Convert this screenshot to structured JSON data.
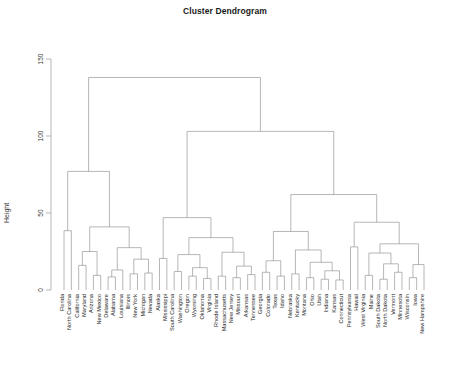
{
  "chart_data": {
    "type": "dendrogram",
    "title": "Cluster Dendrogram",
    "xlabel": "",
    "ylabel": "Height",
    "ylim": [
      0,
      155
    ],
    "yticks": [
      0,
      50,
      100,
      150
    ],
    "ytick_labels": [
      "0",
      "50",
      "100",
      "150"
    ],
    "grid": false,
    "legend": null,
    "linkage": "complete",
    "n_leaves": 50,
    "leaf_order": [
      "Florida",
      "North Carolina",
      "California",
      "Maryland",
      "Arizona",
      "New Mexico",
      "Delaware",
      "Alabama",
      "Louisiana",
      "Illinois",
      "New York",
      "Michigan",
      "Nevada",
      "Alaska",
      "Mississippi",
      "South Carolina",
      "Washington",
      "Oregon",
      "Wyoming",
      "Oklahoma",
      "Virginia",
      "Rhode Island",
      "Massachusetts",
      "New Jersey",
      "Missouri",
      "Arkansas",
      "Tennessee",
      "Georgia",
      "Colorado",
      "Texas",
      "Idaho",
      "Nebraska",
      "Kentucky",
      "Montana",
      "Ohio",
      "Utah",
      "Indiana",
      "Kansas",
      "Connecticut",
      "Pennsylvania",
      "Hawaii",
      "West Virginia",
      "Maine",
      "South Dakota",
      "North Dakota",
      "Vermont",
      "Minnesota",
      "Wisconsin",
      "Iowa",
      "New Hampshire"
    ],
    "merges": [
      {
        "id": 1,
        "left": "Florida",
        "right": "North Carolina",
        "height": 38.5
      },
      {
        "id": 2,
        "left": "California",
        "right": "Maryland",
        "height": 16.0
      },
      {
        "id": 3,
        "left": "Arizona",
        "right": "New Mexico",
        "height": 9.5
      },
      {
        "id": 4,
        "left": "m2",
        "right": "m3",
        "height": 25.0
      },
      {
        "id": 5,
        "left": "Delaware",
        "right": "Alabama",
        "height": 8.5
      },
      {
        "id": 6,
        "left": "m5",
        "right": "Louisiana",
        "height": 13.0
      },
      {
        "id": 7,
        "left": "Illinois",
        "right": "New York",
        "height": 10.5
      },
      {
        "id": 8,
        "left": "Michigan",
        "right": "Nevada",
        "height": 11.0
      },
      {
        "id": 9,
        "left": "m7",
        "right": "m8",
        "height": 20.0
      },
      {
        "id": 10,
        "left": "m6",
        "right": "m9",
        "height": 27.5
      },
      {
        "id": 11,
        "left": "m4",
        "right": "m10",
        "height": 41.0
      },
      {
        "id": 12,
        "left": "m1",
        "right": "m11",
        "height": 77.0
      },
      {
        "id": 13,
        "left": "Alaska",
        "right": "Mississippi",
        "height": 20.5
      },
      {
        "id": 14,
        "left": "South Carolina",
        "right": "Washington",
        "height": 12.0
      },
      {
        "id": 15,
        "left": "Oregon",
        "right": "Wyoming",
        "height": 9.0
      },
      {
        "id": 16,
        "left": "Oklahoma",
        "right": "Virginia",
        "height": 7.5
      },
      {
        "id": 17,
        "left": "m15",
        "right": "m16",
        "height": 14.5
      },
      {
        "id": 18,
        "left": "m14",
        "right": "m17",
        "height": 23.0
      },
      {
        "id": 19,
        "left": "Rhode Island",
        "right": "Massachusetts",
        "height": 9.0
      },
      {
        "id": 20,
        "left": "New Jersey",
        "right": "Missouri",
        "height": 8.0
      },
      {
        "id": 21,
        "left": "Arkansas",
        "right": "Tennessee",
        "height": 10.0
      },
      {
        "id": 22,
        "left": "m20",
        "right": "m21",
        "height": 15.5
      },
      {
        "id": 23,
        "left": "m19",
        "right": "m22",
        "height": 24.5
      },
      {
        "id": 24,
        "left": "m18",
        "right": "m23",
        "height": 34.0
      },
      {
        "id": 25,
        "left": "m13",
        "right": "m24",
        "height": 47.0
      },
      {
        "id": 26,
        "left": "Georgia",
        "right": "Colorado",
        "height": 11.5
      },
      {
        "id": 27,
        "left": "Texas",
        "right": "Idaho",
        "height": 9.0
      },
      {
        "id": 28,
        "left": "m26",
        "right": "m27",
        "height": 19.0
      },
      {
        "id": 29,
        "left": "Nebraska",
        "right": "Kentucky",
        "height": 10.5
      },
      {
        "id": 30,
        "left": "Montana",
        "right": "Ohio",
        "height": 8.0
      },
      {
        "id": 31,
        "left": "Utah",
        "right": "Indiana",
        "height": 7.0
      },
      {
        "id": 32,
        "left": "Kansas",
        "right": "Connecticut",
        "height": 6.5
      },
      {
        "id": 33,
        "left": "m31",
        "right": "m32",
        "height": 12.5
      },
      {
        "id": 34,
        "left": "m30",
        "right": "m33",
        "height": 18.0
      },
      {
        "id": 35,
        "left": "m29",
        "right": "m34",
        "height": 26.0
      },
      {
        "id": 36,
        "left": "m28",
        "right": "m35",
        "height": 38.0
      },
      {
        "id": 37,
        "left": "Pennsylvania",
        "right": "Hawaii",
        "height": 28.0
      },
      {
        "id": 38,
        "left": "West Virginia",
        "right": "Maine",
        "height": 9.5
      },
      {
        "id": 39,
        "left": "South Dakota",
        "right": "North Dakota",
        "height": 7.0
      },
      {
        "id": 40,
        "left": "Vermont",
        "right": "Minnesota",
        "height": 11.5
      },
      {
        "id": 41,
        "left": "m39",
        "right": "m40",
        "height": 17.0
      },
      {
        "id": 42,
        "left": "m38",
        "right": "m41",
        "height": 24.0
      },
      {
        "id": 43,
        "left": "Wisconsin",
        "right": "Iowa",
        "height": 8.0
      },
      {
        "id": 44,
        "left": "m43",
        "right": "New Hampshire",
        "height": 16.5
      },
      {
        "id": 45,
        "left": "m42",
        "right": "m44",
        "height": 30.0
      },
      {
        "id": 46,
        "left": "m37",
        "right": "m45",
        "height": 44.0
      },
      {
        "id": 47,
        "left": "m36",
        "right": "m46",
        "height": 62.0
      },
      {
        "id": 48,
        "left": "m25",
        "right": "m47",
        "height": 103.0
      },
      {
        "id": 49,
        "left": "m12",
        "right": "m48",
        "height": 138.0
      }
    ]
  },
  "axis": {
    "ylabel": "Height"
  }
}
